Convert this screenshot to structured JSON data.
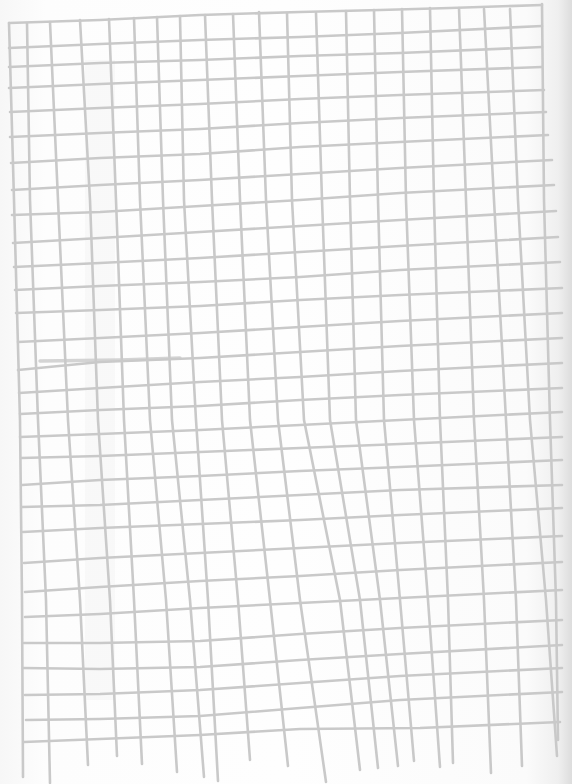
{
  "image": {
    "description": "Hand-drawn grid of light grey lines on white paper",
    "width": 572,
    "height": 784,
    "colors": {
      "paper": "#fbfbfb",
      "line": "#c9c9c9"
    },
    "line_width": 2.6
  },
  "grid": {
    "vertical_lines": [
      [
        [
          9,
          23
        ],
        [
          14,
          200
        ],
        [
          20,
          420
        ],
        [
          22,
          600
        ],
        [
          23,
          777
        ]
      ],
      [
        [
          27,
          23
        ],
        [
          30,
          200
        ],
        [
          38,
          420
        ],
        [
          46,
          600
        ],
        [
          50,
          783
        ]
      ],
      [
        [
          50,
          22
        ],
        [
          58,
          200
        ],
        [
          68,
          420
        ],
        [
          80,
          600
        ],
        [
          88,
          765
        ]
      ],
      [
        [
          80,
          20
        ],
        [
          90,
          200
        ],
        [
          98,
          420
        ],
        [
          110,
          600
        ],
        [
          117,
          756
        ]
      ],
      [
        [
          109,
          19
        ],
        [
          116,
          200
        ],
        [
          124,
          420
        ],
        [
          134,
          600
        ],
        [
          142,
          764
        ]
      ],
      [
        [
          134,
          18
        ],
        [
          140,
          200
        ],
        [
          150,
          420
        ],
        [
          166,
          600
        ],
        [
          177,
          772
        ]
      ],
      [
        [
          157,
          17
        ],
        [
          163,
          200
        ],
        [
          172,
          420
        ],
        [
          190,
          600
        ],
        [
          204,
          777
        ]
      ],
      [
        [
          180,
          16
        ],
        [
          184,
          200
        ],
        [
          196,
          420
        ],
        [
          208,
          600
        ],
        [
          218,
          781
        ]
      ],
      [
        [
          205,
          15
        ],
        [
          212,
          200
        ],
        [
          222,
          420
        ],
        [
          238,
          600
        ],
        [
          250,
          760
        ]
      ],
      [
        [
          233,
          14
        ],
        [
          240,
          200
        ],
        [
          250,
          420
        ],
        [
          270,
          600
        ],
        [
          288,
          766
        ]
      ],
      [
        [
          259,
          12
        ],
        [
          266,
          200
        ],
        [
          278,
          420
        ],
        [
          300,
          600
        ],
        [
          326,
          782
        ]
      ],
      [
        [
          287,
          13
        ],
        [
          292,
          200
        ],
        [
          304,
          420
        ],
        [
          340,
          600
        ],
        [
          360,
          770
        ]
      ],
      [
        [
          316,
          13
        ],
        [
          322,
          200
        ],
        [
          330,
          420
        ],
        [
          360,
          600
        ],
        [
          378,
          768
        ]
      ],
      [
        [
          346,
          11
        ],
        [
          350,
          200
        ],
        [
          356,
          420
        ],
        [
          380,
          600
        ],
        [
          398,
          766
        ]
      ],
      [
        [
          374,
          10
        ],
        [
          378,
          200
        ],
        [
          384,
          420
        ],
        [
          400,
          600
        ],
        [
          414,
          761
        ]
      ],
      [
        [
          402,
          9
        ],
        [
          406,
          200
        ],
        [
          414,
          420
        ],
        [
          428,
          600
        ],
        [
          440,
          767
        ]
      ],
      [
        [
          430,
          8
        ],
        [
          434,
          200
        ],
        [
          440,
          420
        ],
        [
          448,
          600
        ],
        [
          453,
          763
        ]
      ],
      [
        [
          459,
          8
        ],
        [
          466,
          200
        ],
        [
          474,
          420
        ],
        [
          484,
          600
        ],
        [
          491,
          773
        ]
      ],
      [
        [
          484,
          9
        ],
        [
          494,
          200
        ],
        [
          506,
          420
        ],
        [
          516,
          600
        ],
        [
          522,
          766
        ]
      ],
      [
        [
          510,
          9
        ],
        [
          518,
          200
        ],
        [
          530,
          420
        ],
        [
          546,
          600
        ],
        [
          557,
          756
        ]
      ],
      [
        [
          542,
          4
        ],
        [
          544,
          200
        ],
        [
          550,
          420
        ],
        [
          556,
          600
        ],
        [
          558,
          740
        ]
      ]
    ],
    "horizontal_lines": [
      [
        [
          9,
          23
        ],
        [
          100,
          20
        ],
        [
          200,
          15
        ],
        [
          300,
          12
        ],
        [
          380,
          10
        ],
        [
          450,
          8
        ],
        [
          542,
          5
        ]
      ],
      [
        [
          9,
          48
        ],
        [
          100,
          44
        ],
        [
          200,
          40
        ],
        [
          300,
          37
        ],
        [
          400,
          33
        ],
        [
          542,
          26
        ]
      ],
      [
        [
          9,
          67
        ],
        [
          100,
          63
        ],
        [
          200,
          60
        ],
        [
          300,
          56
        ],
        [
          400,
          53
        ],
        [
          542,
          47
        ]
      ],
      [
        [
          9,
          88
        ],
        [
          100,
          84
        ],
        [
          200,
          80
        ],
        [
          300,
          76
        ],
        [
          400,
          72
        ],
        [
          542,
          67
        ]
      ],
      [
        [
          10,
          112
        ],
        [
          100,
          108
        ],
        [
          200,
          104
        ],
        [
          300,
          99
        ],
        [
          400,
          95
        ],
        [
          544,
          90
        ]
      ],
      [
        [
          10,
          137
        ],
        [
          100,
          133
        ],
        [
          200,
          129
        ],
        [
          300,
          123
        ],
        [
          400,
          118
        ],
        [
          546,
          112
        ]
      ],
      [
        [
          11,
          163
        ],
        [
          100,
          158
        ],
        [
          200,
          154
        ],
        [
          300,
          147
        ],
        [
          400,
          142
        ],
        [
          548,
          135
        ]
      ],
      [
        [
          12,
          190
        ],
        [
          100,
          185
        ],
        [
          200,
          180
        ],
        [
          300,
          174
        ],
        [
          400,
          168
        ],
        [
          552,
          160
        ]
      ],
      [
        [
          12,
          215
        ],
        [
          100,
          212
        ],
        [
          200,
          206
        ],
        [
          300,
          200
        ],
        [
          400,
          193
        ],
        [
          554,
          185
        ]
      ],
      [
        [
          13,
          243
        ],
        [
          100,
          238
        ],
        [
          200,
          232
        ],
        [
          300,
          226
        ],
        [
          400,
          220
        ],
        [
          556,
          211
        ]
      ],
      [
        [
          14,
          267
        ],
        [
          100,
          263
        ],
        [
          200,
          258
        ],
        [
          300,
          252
        ],
        [
          400,
          246
        ],
        [
          558,
          237
        ]
      ],
      [
        [
          15,
          290
        ],
        [
          100,
          286
        ],
        [
          200,
          282
        ],
        [
          300,
          277
        ],
        [
          400,
          270
        ],
        [
          560,
          262
        ]
      ],
      [
        [
          16,
          313
        ],
        [
          100,
          310
        ],
        [
          200,
          306
        ],
        [
          300,
          300
        ],
        [
          400,
          295
        ],
        [
          562,
          288
        ]
      ],
      [
        [
          18,
          342
        ],
        [
          100,
          338
        ],
        [
          200,
          333
        ],
        [
          300,
          327
        ],
        [
          400,
          321
        ],
        [
          562,
          313
        ]
      ],
      [
        [
          18,
          370
        ],
        [
          100,
          362
        ],
        [
          200,
          358
        ],
        [
          300,
          352
        ],
        [
          400,
          346
        ],
        [
          562,
          338
        ]
      ],
      [
        [
          19,
          393
        ],
        [
          100,
          388
        ],
        [
          200,
          382
        ],
        [
          300,
          377
        ],
        [
          400,
          371
        ],
        [
          562,
          363
        ]
      ],
      [
        [
          20,
          414
        ],
        [
          100,
          410
        ],
        [
          200,
          406
        ],
        [
          300,
          400
        ],
        [
          400,
          395
        ],
        [
          562,
          388
        ]
      ],
      [
        [
          20,
          437
        ],
        [
          100,
          434
        ],
        [
          200,
          430
        ],
        [
          300,
          425
        ],
        [
          400,
          420
        ],
        [
          562,
          412
        ]
      ],
      [
        [
          21,
          458
        ],
        [
          100,
          456
        ],
        [
          200,
          452
        ],
        [
          300,
          448
        ],
        [
          400,
          444
        ],
        [
          562,
          437
        ]
      ],
      [
        [
          22,
          485
        ],
        [
          100,
          480
        ],
        [
          200,
          476
        ],
        [
          300,
          471
        ],
        [
          400,
          467
        ],
        [
          562,
          460
        ]
      ],
      [
        [
          22,
          507
        ],
        [
          100,
          505
        ],
        [
          200,
          500
        ],
        [
          300,
          495
        ],
        [
          400,
          490
        ],
        [
          562,
          485
        ]
      ],
      [
        [
          23,
          532
        ],
        [
          100,
          528
        ],
        [
          200,
          524
        ],
        [
          300,
          520
        ],
        [
          400,
          515
        ],
        [
          562,
          508
        ]
      ],
      [
        [
          24,
          563
        ],
        [
          100,
          558
        ],
        [
          200,
          553
        ],
        [
          300,
          548
        ],
        [
          400,
          543
        ],
        [
          562,
          536
        ]
      ],
      [
        [
          25,
          592
        ],
        [
          100,
          587
        ],
        [
          200,
          581
        ],
        [
          300,
          576
        ],
        [
          400,
          570
        ],
        [
          562,
          562
        ]
      ],
      [
        [
          25,
          617
        ],
        [
          100,
          614
        ],
        [
          200,
          608
        ],
        [
          300,
          603
        ],
        [
          400,
          598
        ],
        [
          562,
          590
        ]
      ],
      [
        [
          24,
          643
        ],
        [
          100,
          643
        ],
        [
          200,
          641
        ],
        [
          300,
          634
        ],
        [
          400,
          628
        ],
        [
          562,
          620
        ]
      ],
      [
        [
          23,
          668
        ],
        [
          100,
          669
        ],
        [
          200,
          667
        ],
        [
          300,
          660
        ],
        [
          400,
          654
        ],
        [
          562,
          645
        ]
      ],
      [
        [
          25,
          695
        ],
        [
          100,
          694
        ],
        [
          200,
          690
        ],
        [
          300,
          683
        ],
        [
          400,
          676
        ],
        [
          562,
          668
        ]
      ],
      [
        [
          26,
          720
        ],
        [
          100,
          719
        ],
        [
          200,
          716
        ],
        [
          300,
          708
        ],
        [
          400,
          700
        ],
        [
          562,
          692
        ]
      ],
      [
        [
          24,
          742
        ],
        [
          100,
          739
        ],
        [
          200,
          735
        ],
        [
          300,
          729
        ],
        [
          420,
          728
        ],
        [
          560,
          722
        ]
      ]
    ],
    "pencil_marks": [
      [
        [
          40,
          361
        ],
        [
          120,
          360
        ],
        [
          180,
          358
        ]
      ]
    ]
  }
}
